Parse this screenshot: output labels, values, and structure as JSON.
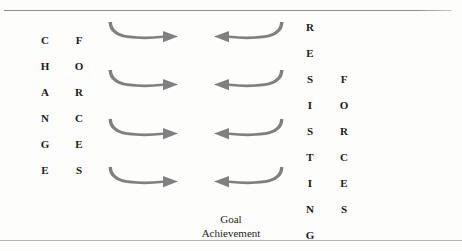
{
  "figure": {
    "background_color": "#fdfdfc",
    "rule_color": "#9a9a9a",
    "arrow_color": "#808080",
    "text_color": "#1b1b1b"
  },
  "left_block": {
    "columns": [
      {
        "name": "change",
        "word": "CHANGE",
        "letters": [
          "C",
          "H",
          "A",
          "N",
          "G",
          "E"
        ]
      },
      {
        "name": "forces-left",
        "word": "FORCES",
        "letters": [
          "F",
          "O",
          "R",
          "C",
          "E",
          "S"
        ]
      }
    ]
  },
  "right_block": {
    "columns": [
      {
        "name": "resisting",
        "word": "RESISTING",
        "letters": [
          "R",
          "E",
          "S",
          "I",
          "S",
          "T",
          "I",
          "N",
          "G"
        ]
      },
      {
        "name": "forces-right",
        "word": "FORCES",
        "letters": [
          "F",
          "O",
          "R",
          "C",
          "E",
          "S"
        ]
      }
    ]
  },
  "arrows": {
    "row_count": 4,
    "color": "#808080",
    "rows": [
      {
        "right": "arrow-right-curved",
        "left": "arrow-left-curved"
      },
      {
        "right": "arrow-right-curved",
        "left": "arrow-left-curved"
      },
      {
        "right": "arrow-right-curved",
        "left": "arrow-left-curved"
      },
      {
        "right": "arrow-right-curved",
        "left": "arrow-left-curved"
      }
    ]
  },
  "caption": {
    "line1": "Goal",
    "line2": "Achievement"
  }
}
